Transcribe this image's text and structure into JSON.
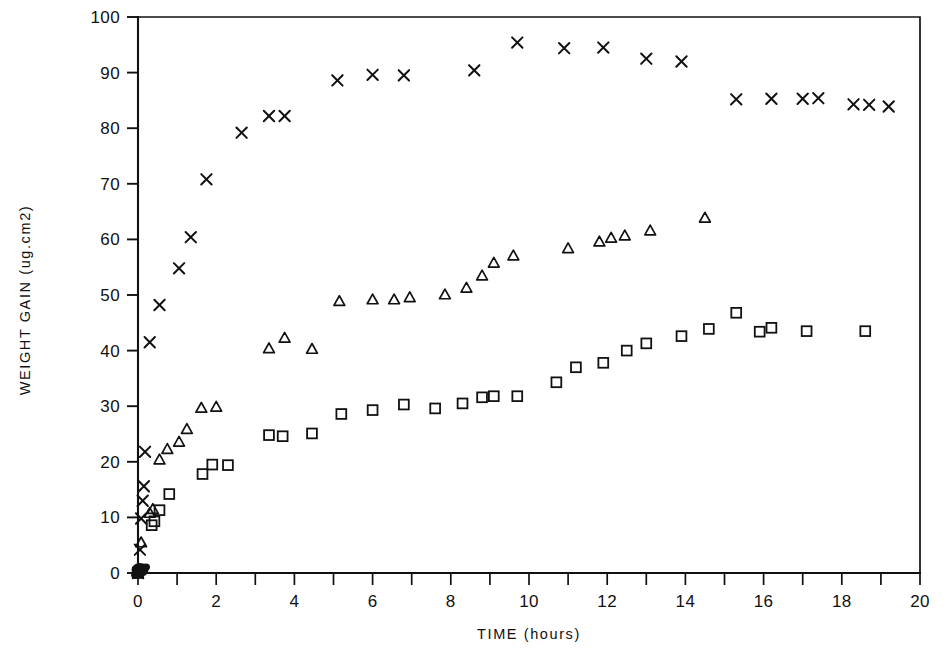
{
  "chart_data": {
    "type": "scatter",
    "title": "",
    "xlabel": "TIME (hours)",
    "ylabel": "WEIGHT GAIN  (ug.cm2)",
    "xlim": [
      0,
      20
    ],
    "ylim": [
      0,
      100
    ],
    "xticks": [
      0,
      1,
      2,
      3,
      4,
      5,
      6,
      7,
      8,
      9,
      10,
      11,
      12,
      13,
      14,
      15,
      16,
      17,
      18,
      19,
      20
    ],
    "xtick_labels": [
      "0",
      "",
      "2",
      "",
      "4",
      "",
      "6",
      "",
      "8",
      "",
      "10",
      "",
      "12",
      "",
      "14",
      "",
      "16",
      "",
      "18",
      "",
      "20"
    ],
    "yticks": [
      0,
      10,
      20,
      30,
      40,
      50,
      60,
      70,
      80,
      90,
      100
    ],
    "ytick_labels": [
      "0",
      "10",
      "20",
      "30",
      "40",
      "50",
      "60",
      "70",
      "80",
      "90",
      "100"
    ],
    "grid": false,
    "legend": "none",
    "series": [
      {
        "name": "series-cross",
        "marker": "x",
        "color": "#111111",
        "points": [
          [
            0.0,
            0.0
          ],
          [
            0.05,
            4.2
          ],
          [
            0.08,
            9.8
          ],
          [
            0.12,
            13.0
          ],
          [
            0.15,
            15.6
          ],
          [
            0.18,
            21.8
          ],
          [
            0.3,
            41.5
          ],
          [
            0.55,
            48.2
          ],
          [
            1.05,
            54.8
          ],
          [
            1.35,
            60.4
          ],
          [
            1.75,
            70.8
          ],
          [
            2.65,
            79.2
          ],
          [
            3.35,
            82.2
          ],
          [
            3.75,
            82.2
          ],
          [
            5.1,
            88.6
          ],
          [
            6.0,
            89.6
          ],
          [
            6.8,
            89.5
          ],
          [
            8.6,
            90.4
          ],
          [
            9.7,
            95.4
          ],
          [
            10.9,
            94.4
          ],
          [
            11.9,
            94.5
          ],
          [
            13.0,
            92.5
          ],
          [
            13.9,
            92.0
          ],
          [
            15.3,
            85.2
          ],
          [
            16.2,
            85.3
          ],
          [
            17.0,
            85.3
          ],
          [
            17.4,
            85.4
          ],
          [
            18.3,
            84.3
          ],
          [
            18.7,
            84.2
          ],
          [
            19.2,
            83.9
          ]
        ]
      },
      {
        "name": "series-triangle",
        "marker": "triangle",
        "color": "#111111",
        "points": [
          [
            0.0,
            0.0
          ],
          [
            0.08,
            5.5
          ],
          [
            0.3,
            10.8
          ],
          [
            0.38,
            11.5
          ],
          [
            0.55,
            20.4
          ],
          [
            0.75,
            22.3
          ],
          [
            1.05,
            23.6
          ],
          [
            1.25,
            25.9
          ],
          [
            1.62,
            29.7
          ],
          [
            2.0,
            29.9
          ],
          [
            3.35,
            40.4
          ],
          [
            3.75,
            42.3
          ],
          [
            4.45,
            40.3
          ],
          [
            5.15,
            48.9
          ],
          [
            6.0,
            49.2
          ],
          [
            6.55,
            49.2
          ],
          [
            6.95,
            49.6
          ],
          [
            7.85,
            50.1
          ],
          [
            8.4,
            51.3
          ],
          [
            8.8,
            53.5
          ],
          [
            9.1,
            55.8
          ],
          [
            9.6,
            57.1
          ],
          [
            11.0,
            58.4
          ],
          [
            11.8,
            59.6
          ],
          [
            12.1,
            60.3
          ],
          [
            12.45,
            60.7
          ],
          [
            13.1,
            61.6
          ],
          [
            14.5,
            63.9
          ]
        ]
      },
      {
        "name": "series-square",
        "marker": "square",
        "color": "#111111",
        "points": [
          [
            0.0,
            0.0
          ],
          [
            0.35,
            8.6
          ],
          [
            0.42,
            9.3
          ],
          [
            0.55,
            11.3
          ],
          [
            0.8,
            14.2
          ],
          [
            1.65,
            17.8
          ],
          [
            1.9,
            19.5
          ],
          [
            2.3,
            19.4
          ],
          [
            3.35,
            24.8
          ],
          [
            3.7,
            24.6
          ],
          [
            4.45,
            25.1
          ],
          [
            5.2,
            28.6
          ],
          [
            6.0,
            29.3
          ],
          [
            6.8,
            30.3
          ],
          [
            7.6,
            29.6
          ],
          [
            8.3,
            30.5
          ],
          [
            8.8,
            31.6
          ],
          [
            9.1,
            31.8
          ],
          [
            9.7,
            31.8
          ],
          [
            10.7,
            34.3
          ],
          [
            11.2,
            37.0
          ],
          [
            11.9,
            37.8
          ],
          [
            12.5,
            40.0
          ],
          [
            13.0,
            41.3
          ],
          [
            13.9,
            42.6
          ],
          [
            14.6,
            43.9
          ],
          [
            15.3,
            46.8
          ],
          [
            15.9,
            43.4
          ],
          [
            16.2,
            44.1
          ],
          [
            17.1,
            43.5
          ],
          [
            18.6,
            43.5
          ]
        ]
      }
    ]
  },
  "axes": {
    "x_axis_name": "time-axis",
    "y_axis_name": "weight-gain-axis"
  }
}
